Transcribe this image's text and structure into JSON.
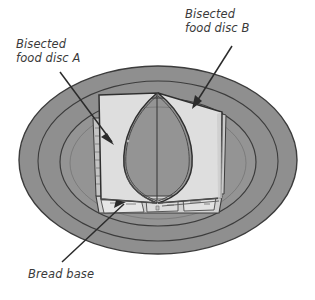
{
  "figure": {
    "name": "bisected-sandwich-on-plate-diagram",
    "background_color": "#ffffff"
  },
  "labels": {
    "disc_a": "Bisected\nfood disc A",
    "disc_b": "Bisected\nfood disc B",
    "bread_base": "Bread base"
  },
  "colors": {
    "plate_rim": "#8f8f8f",
    "plate_well": "#949494",
    "plate_outline": "#3c3c3c",
    "bread_top": "#dedede",
    "bread_side": "#c9c9c9",
    "bread_shadow": "#b4b4b4",
    "filling": "#e4e4e4",
    "label_text": "#3a3a3a",
    "arrow": "#2b2b2b"
  },
  "parts": {
    "plate": "plate",
    "plate_rim_ring_outer": "plate-rim-ring-outer",
    "plate_rim_ring_inner": "plate-rim-ring-inner",
    "plate_well": "plate-well",
    "disc_a": "bisected-food-disc-a",
    "disc_b": "bisected-food-disc-b",
    "bread_base": "bread-base"
  },
  "annotations": [
    {
      "id": "arrow-disc-a",
      "from": [
        60,
        72
      ],
      "to": [
        114,
        144
      ]
    },
    {
      "id": "arrow-disc-b",
      "from": [
        232,
        46
      ],
      "to": [
        192,
        108
      ]
    },
    {
      "id": "arrow-bread-base",
      "from": [
        62,
        262
      ],
      "to": [
        123,
        205
      ]
    }
  ]
}
